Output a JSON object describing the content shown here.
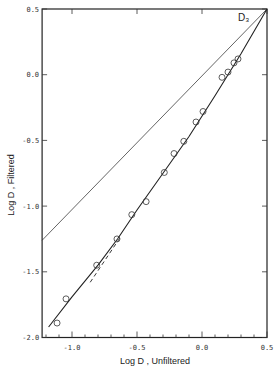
{
  "chart_data": {
    "type": "scatter",
    "title": "",
    "annotation": "D₃",
    "xlabel": "Log D , Unfiltered",
    "ylabel": "Log D , Filtered",
    "xlim": [
      -1.23,
      0.5
    ],
    "ylim": [
      -2.0,
      0.5
    ],
    "x_ticks": [
      -1.0,
      -0.5,
      0.0,
      0.5
    ],
    "x_tick_labels": [
      "-1.0",
      "-0.5",
      "0.0",
      "0.5"
    ],
    "y_ticks": [
      0.5,
      0.0,
      -0.5,
      -1.0,
      -1.5,
      -2.0
    ],
    "y_tick_labels": [
      "0.5",
      "0.0",
      "-0.5",
      "-1.0",
      "-1.5",
      "-2.0"
    ],
    "x_minor_step": 0.1,
    "grid": false,
    "legend": null,
    "series": [
      {
        "name": "Observed points",
        "style": "open-circle",
        "x": [
          -1.115,
          -1.046,
          -0.81,
          -0.654,
          -0.54,
          -0.43,
          -0.29,
          -0.215,
          -0.14,
          -0.046,
          0.008,
          0.154,
          0.2,
          0.246,
          0.277
        ],
        "y": [
          -1.89,
          -1.706,
          -1.45,
          -1.25,
          -1.065,
          -0.966,
          -0.744,
          -0.6,
          -0.507,
          -0.36,
          -0.28,
          -0.02,
          0.02,
          0.09,
          0.12
        ]
      },
      {
        "name": "Fitted curve",
        "style": "solid",
        "x": [
          -1.18,
          -1.0,
          -0.8,
          -0.65,
          -0.5,
          -0.3,
          -0.1,
          0.1,
          0.3,
          0.5
        ],
        "y": [
          -1.92,
          -1.69,
          -1.45,
          -1.25,
          -1.03,
          -0.75,
          -0.47,
          -0.16,
          0.16,
          0.5
        ]
      },
      {
        "name": "Extrapolation (dashed)",
        "style": "dashed",
        "x": [
          -0.86,
          -0.63
        ],
        "y": [
          -1.58,
          -1.24
        ]
      },
      {
        "name": "1:1 line",
        "style": "thin-solid",
        "x": [
          -1.23,
          0.5
        ],
        "y": [
          -1.26,
          0.5
        ]
      }
    ]
  }
}
